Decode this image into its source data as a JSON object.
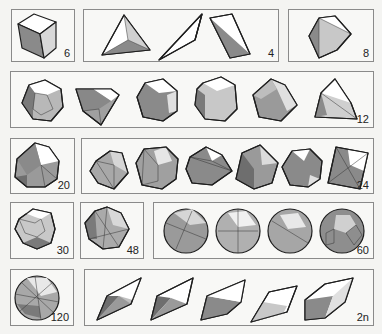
{
  "figure": {
    "palette": {
      "light": "#ffffff",
      "mid": "#c4c4c4",
      "dark": "#8a8a8a",
      "darker": "#6e6e6e",
      "edge": "#1e1e1e"
    },
    "groups": [
      {
        "id": "g6",
        "label": "6",
        "shapes": [
          "cube"
        ]
      },
      {
        "id": "g4",
        "label": "4",
        "shapes": [
          "tetrahedron",
          "tetrahedron-wire",
          "tetrahedron-edge-view"
        ]
      },
      {
        "id": "g8",
        "label": "8",
        "shapes": [
          "octahedron"
        ]
      },
      {
        "id": "g12",
        "label": "12",
        "shapes": [
          "dodecahedron",
          "truncated-tetrahedron",
          "pyritohedron",
          "truncated-cube",
          "rhombic-polyhedron",
          "triakis-tetrahedron"
        ]
      },
      {
        "id": "g20",
        "label": "20",
        "shapes": [
          "icosahedron"
        ]
      },
      {
        "id": "g24",
        "label": "24",
        "shapes": [
          "pentakis-polyhedron",
          "deltoidal-polyhedron",
          "pentagonal-icositetrahedron",
          "tetrakis-hexahedron-a",
          "truncated-octahedron",
          "tetrakis-hexahedron-b"
        ]
      },
      {
        "id": "g30",
        "label": "30",
        "shapes": [
          "rhombic-triacontahedron"
        ]
      },
      {
        "id": "g48",
        "label": "48",
        "shapes": [
          "disdyakis-dodecahedron"
        ]
      },
      {
        "id": "g60",
        "label": "60",
        "shapes": [
          "pentakis-dodecahedron",
          "deltoidal-hexecontahedron",
          "pentagonal-hexecontahedron",
          "truncated-icosahedron"
        ]
      },
      {
        "id": "g120",
        "label": "120",
        "shapes": [
          "disdyakis-triacontahedron"
        ]
      },
      {
        "id": "g2n",
        "label": "2n",
        "shapes": [
          "bipyramid-a",
          "bipyramid-b",
          "trapezohedron-a",
          "trapezohedron-b",
          "rhombohedron"
        ]
      }
    ]
  }
}
